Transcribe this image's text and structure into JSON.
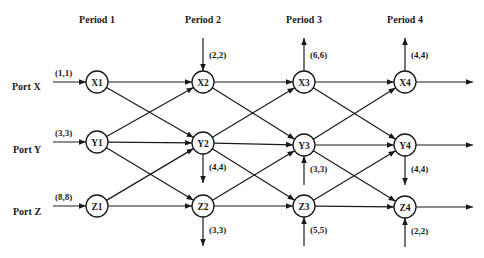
{
  "diagram": {
    "periods": [
      {
        "label": "Period 1",
        "x": 97
      },
      {
        "label": "Period 2",
        "x": 203
      },
      {
        "label": "Period 3",
        "x": 304
      },
      {
        "label": "Period 4",
        "x": 405
      }
    ],
    "ports": [
      {
        "label": "Port X",
        "y": 82,
        "input_label": "(1,1)"
      },
      {
        "label": "Port Y",
        "y": 144,
        "input_label": "(3,3)"
      },
      {
        "label": "Port Z",
        "y": 206,
        "input_label": "(8,8)"
      }
    ],
    "nodes": [
      {
        "id": "X1",
        "label": "X1",
        "x": 97,
        "y": 82
      },
      {
        "id": "Y1",
        "label": "Y1",
        "x": 97,
        "y": 142
      },
      {
        "id": "Z1",
        "label": "Z1",
        "x": 97,
        "y": 206
      },
      {
        "id": "X2",
        "label": "X2",
        "x": 203,
        "y": 82
      },
      {
        "id": "Y2",
        "label": "Y2",
        "x": 203,
        "y": 143
      },
      {
        "id": "Z2",
        "label": "Z2",
        "x": 203,
        "y": 206
      },
      {
        "id": "X3",
        "label": "X3",
        "x": 304,
        "y": 82
      },
      {
        "id": "Y3",
        "label": "Y3",
        "x": 304,
        "y": 145
      },
      {
        "id": "Z3",
        "label": "Z3",
        "x": 304,
        "y": 206
      },
      {
        "id": "X4",
        "label": "X4",
        "x": 405,
        "y": 82
      },
      {
        "id": "Y4",
        "label": "Y4",
        "x": 405,
        "y": 145
      },
      {
        "id": "Z4",
        "label": "Z4",
        "x": 405,
        "y": 207
      }
    ],
    "edges": [
      [
        "X1",
        "X2"
      ],
      [
        "X1",
        "Y2"
      ],
      [
        "Y1",
        "X2"
      ],
      [
        "Y1",
        "Y2"
      ],
      [
        "Y1",
        "Z2"
      ],
      [
        "Z1",
        "Y2"
      ],
      [
        "Z1",
        "Z2"
      ],
      [
        "X2",
        "X3"
      ],
      [
        "X2",
        "Y3"
      ],
      [
        "Y2",
        "X3"
      ],
      [
        "Y2",
        "Y3"
      ],
      [
        "Y2",
        "Z3"
      ],
      [
        "Z2",
        "Y3"
      ],
      [
        "Z2",
        "Z3"
      ],
      [
        "X3",
        "X4"
      ],
      [
        "X3",
        "Y4"
      ],
      [
        "Y3",
        "X4"
      ],
      [
        "Y3",
        "Y4"
      ],
      [
        "Y3",
        "Z4"
      ],
      [
        "Z3",
        "Y4"
      ],
      [
        "Z3",
        "Z4"
      ]
    ],
    "inputs": [
      {
        "node": "X1",
        "label": "(1,1)"
      },
      {
        "node": "Y1",
        "label": "(3,3)"
      },
      {
        "node": "Z1",
        "label": "(8,8)"
      }
    ],
    "external_flows": [
      {
        "node": "X2",
        "direction": "in-from-top",
        "label": "(2,2)"
      },
      {
        "node": "Y2",
        "direction": "out-down",
        "label": "(4,4)"
      },
      {
        "node": "Z2",
        "direction": "out-down",
        "label": "(3,3)"
      },
      {
        "node": "X3",
        "direction": "out-up",
        "label": "(6,6)"
      },
      {
        "node": "Y3",
        "direction": "in-from-bottom",
        "label": "(3,3)"
      },
      {
        "node": "Z3",
        "direction": "in-from-bottom",
        "label": "(5,5)"
      },
      {
        "node": "X4",
        "direction": "out-up",
        "label": "(4,4)"
      },
      {
        "node": "Y4",
        "direction": "out-down",
        "label": "(4,4)"
      },
      {
        "node": "Z4",
        "direction": "in-from-bottom",
        "label": "(2,2)"
      }
    ],
    "outputs": [
      "X4",
      "Y4",
      "Z4"
    ]
  }
}
